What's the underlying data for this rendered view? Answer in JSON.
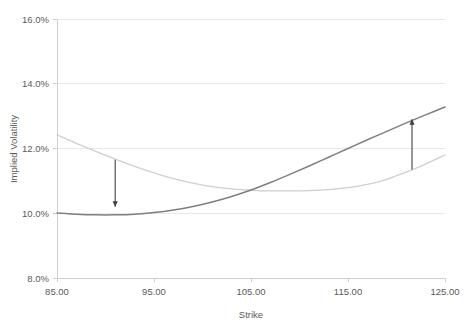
{
  "chart_data": {
    "type": "line",
    "title": "",
    "xlabel": "Strike",
    "ylabel": "Implied Volatility",
    "xlim": [
      85,
      125
    ],
    "ylim": [
      0.08,
      0.16
    ],
    "grid": true,
    "legend_position": "none",
    "xticks": [
      85,
      95,
      105,
      115,
      125
    ],
    "xtick_labels": [
      "85.00",
      "95.00",
      "105.00",
      "115.00",
      "125.00"
    ],
    "yticks": [
      0.08,
      0.1,
      0.12,
      0.14,
      0.16
    ],
    "ytick_labels": [
      "8.0%",
      "10.0%",
      "12.0%",
      "14.0%",
      "16.0%"
    ],
    "x": [
      85,
      87,
      89,
      91,
      93,
      95,
      97,
      99,
      101,
      103,
      105,
      107,
      109,
      111,
      113,
      115,
      117,
      119,
      121,
      123,
      125
    ],
    "series": [
      {
        "name": "original-skew",
        "color": "#cfcfcf",
        "width": 1.3,
        "values": [
          0.1242,
          0.1216,
          0.1191,
          0.1167,
          0.1145,
          0.1125,
          0.1107,
          0.1093,
          0.1082,
          0.1075,
          0.1071,
          0.1069,
          0.1069,
          0.107,
          0.1073,
          0.1079,
          0.1089,
          0.1105,
          0.1127,
          0.1152,
          0.118
        ]
      },
      {
        "name": "shifted-skew",
        "color": "#7f7f7f",
        "width": 1.5,
        "values": [
          0.1001,
          0.0997,
          0.0995,
          0.0995,
          0.0997,
          0.1002,
          0.101,
          0.1021,
          0.1035,
          0.1052,
          0.1072,
          0.1095,
          0.112,
          0.1146,
          0.1173,
          0.12,
          0.1227,
          0.1253,
          0.1279,
          0.1304,
          0.1328
        ]
      }
    ],
    "annotations": [
      {
        "name": "down-arrow",
        "direction": "down",
        "x": 91.0,
        "y_start": 0.1165,
        "y_end": 0.102,
        "color": "#3f3f3f"
      },
      {
        "name": "up-arrow",
        "direction": "up",
        "x": 121.6,
        "y_start": 0.1135,
        "y_end": 0.129,
        "color": "#3f3f3f"
      }
    ]
  },
  "axes": {
    "x_title": "Strike",
    "y_title": "Implied Volatility"
  }
}
